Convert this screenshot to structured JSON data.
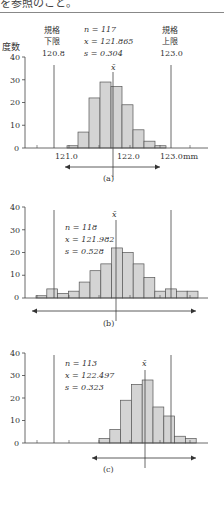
{
  "header": {
    "text": "を参照のこと。"
  },
  "chart_data": [
    {
      "type": "bar",
      "caption": "(a)",
      "ylabel": "度数",
      "xunit": "mm",
      "yticks": [
        0,
        10,
        20,
        30,
        40
      ],
      "ylim": [
        0,
        40
      ],
      "xtick_labels": [
        "121.0",
        "122.0",
        "123.0mm"
      ],
      "stats": {
        "n": "n = 117",
        "xbar": "x = 121.865",
        "s": "s = 0.304"
      },
      "spec_lower": {
        "label1": "規格",
        "label2": "下限",
        "value": "120.8"
      },
      "spec_upper": {
        "label1": "規格",
        "label2": "上限",
        "value": "123.0"
      },
      "mean_label": "x̄",
      "values": [
        1,
        7,
        22,
        29,
        27,
        19,
        8,
        3,
        1
      ]
    },
    {
      "type": "bar",
      "caption": "(b)",
      "yticks": [
        0,
        10,
        20,
        30,
        40
      ],
      "ylim": [
        0,
        40
      ],
      "stats": {
        "n": "n = 118",
        "xbar": "x = 121.982",
        "s": "s = 0.528"
      },
      "mean_label": "x̄",
      "values": [
        1,
        4,
        2,
        3,
        7,
        12,
        15,
        22,
        20,
        15,
        9,
        3,
        4,
        3,
        3
      ]
    },
    {
      "type": "bar",
      "caption": "(c)",
      "yticks": [
        0,
        10,
        20,
        30,
        40
      ],
      "ylim": [
        0,
        40
      ],
      "stats": {
        "n": "n = 113",
        "xbar": "x = 122.497",
        "s": "s = 0.323"
      },
      "mean_label": "x̄",
      "values": [
        2,
        6,
        19,
        26,
        28,
        16,
        12,
        3,
        2
      ]
    }
  ]
}
